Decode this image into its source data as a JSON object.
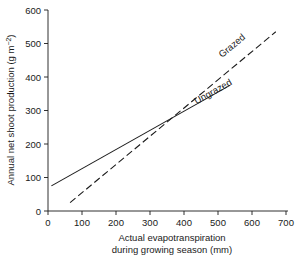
{
  "chart_data": {
    "type": "line",
    "title": "",
    "xlabel": "Actual evapotranspiration\nduring growing season (mm)",
    "xlabel_line1": "Actual evapotranspiration",
    "xlabel_line2": "during growing season (mm)",
    "ylabel": "Annual net shoot production (g m−2)",
    "ylabel_main": "Annual net shoot production (g m",
    "ylabel_exponent": "−2",
    "ylabel_close": ")",
    "xlim": [
      0,
      700
    ],
    "ylim": [
      0,
      600
    ],
    "xticks": [
      0,
      100,
      200,
      300,
      400,
      500,
      600,
      700
    ],
    "yticks": [
      0,
      100,
      200,
      300,
      400,
      500,
      600
    ],
    "xtick_labels": [
      "0",
      "100",
      "200",
      "300",
      "400",
      "500",
      "600",
      "700"
    ],
    "ytick_labels": [
      "0",
      "100",
      "200",
      "300",
      "400",
      "500",
      "600"
    ],
    "grid": false,
    "legend_position": "inline-along-lines",
    "axis_color": "#1a1a1a",
    "background_color": "#ffffff",
    "intersection": {
      "x": 255,
      "y": 170
    },
    "series": [
      {
        "name": "Grazed",
        "label": "Grazed",
        "style": "dashed",
        "color": "#1a1a1a",
        "x": [
          65,
          670
        ],
        "y": [
          25,
          535
        ],
        "endpoints": [
          {
            "x": 65,
            "y": 25
          },
          {
            "x": 670,
            "y": 535
          }
        ],
        "label_anchor": {
          "x": 560,
          "y": 470
        }
      },
      {
        "name": "Ungrazed",
        "label": "Ungrazed",
        "style": "solid",
        "color": "#1a1a1a",
        "x": [
          10,
          535
        ],
        "y": [
          75,
          375
        ],
        "endpoints": [
          {
            "x": 10,
            "y": 75
          },
          {
            "x": 535,
            "y": 375
          }
        ],
        "label_anchor": {
          "x": 500,
          "y": 330
        }
      }
    ]
  }
}
